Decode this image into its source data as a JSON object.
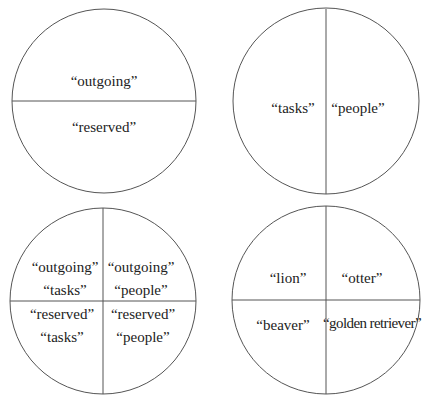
{
  "top_cut_text": "... page ...",
  "diagrams": [
    {
      "name": "outgoing-reserved",
      "labels": [
        "“outgoing”",
        "“reserved”"
      ]
    },
    {
      "name": "tasks-people",
      "labels": [
        "“tasks”",
        "“people”"
      ]
    },
    {
      "name": "combined-quadrants",
      "labels": [
        "“outgoing”",
        "“tasks”",
        "“outgoing”",
        "“people”",
        "“reserved”",
        "“tasks”",
        "“reserved”",
        "“people”"
      ]
    },
    {
      "name": "animal-quadrants",
      "labels": [
        "“lion”",
        "“otter”",
        "“beaver”",
        "“golden retriever”"
      ]
    }
  ],
  "colors": {
    "stroke": "#555555",
    "text": "#222222"
  }
}
